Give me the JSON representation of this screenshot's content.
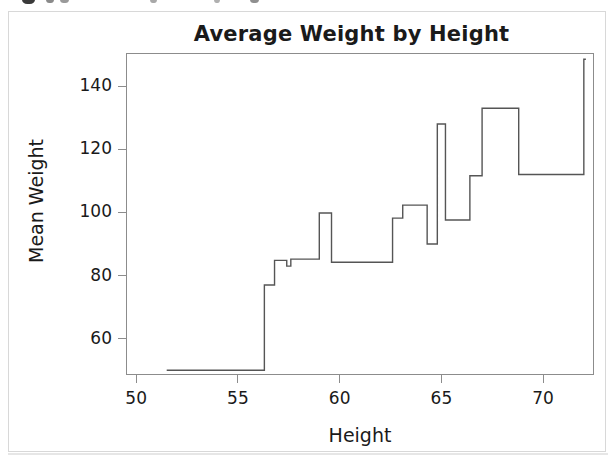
{
  "figure": {
    "background_color": "#ffffff",
    "frame_color": "#d8d8d8",
    "axis_color": "#8c8c8c",
    "line_color": "#555555",
    "text_color": "#1a1a1a"
  },
  "chart_data": {
    "type": "line",
    "subtype": "step",
    "title": "Average Weight by Height",
    "xlabel": "Height",
    "ylabel": "Mean Weight",
    "grid": false,
    "legend": null,
    "xlim": [
      49.5,
      72.5
    ],
    "ylim": [
      48.5,
      150.5
    ],
    "xticks": [
      50,
      55,
      60,
      65,
      70
    ],
    "yticks": [
      60,
      80,
      100,
      120,
      140
    ],
    "xtick_labels": [
      "50",
      "55",
      "60",
      "65",
      "70"
    ],
    "ytick_labels": [
      "60",
      "80",
      "100",
      "120",
      "140"
    ],
    "series": [
      {
        "name": "Mean Weight",
        "x": [
          51.5,
          56.3,
          56.3,
          56.8,
          56.8,
          57.4,
          57.4,
          57.6,
          57.6,
          59.0,
          59.0,
          59.6,
          59.6,
          62.6,
          62.6,
          63.1,
          63.1,
          64.3,
          64.3,
          64.8,
          64.8,
          65.2,
          65.2,
          66.4,
          66.4,
          67.0,
          67.0,
          68.8,
          68.8,
          72.0,
          72.0,
          72.1
        ],
        "y": [
          50.0,
          50.0,
          77.0,
          77.0,
          84.8,
          84.8,
          83.0,
          83.0,
          85.2,
          85.2,
          99.8,
          99.8,
          84.2,
          84.2,
          98.2,
          98.2,
          102.3,
          102.3,
          90.0,
          90.0,
          128.0,
          128.0,
          97.6,
          97.6,
          111.6,
          111.6,
          133.0,
          133.0,
          112.0,
          112.0,
          148.5,
          148.5
        ],
        "steps": [
          {
            "x_start": 51.5,
            "x_end": 56.3,
            "y": 50.0
          },
          {
            "x_start": 56.3,
            "x_end": 56.8,
            "y": 77.0
          },
          {
            "x_start": 56.8,
            "x_end": 57.4,
            "y": 84.8
          },
          {
            "x_start": 57.4,
            "x_end": 57.6,
            "y": 83.0
          },
          {
            "x_start": 57.6,
            "x_end": 59.0,
            "y": 85.2
          },
          {
            "x_start": 59.0,
            "x_end": 59.6,
            "y": 99.8
          },
          {
            "x_start": 59.6,
            "x_end": 62.6,
            "y": 84.2
          },
          {
            "x_start": 62.6,
            "x_end": 63.1,
            "y": 98.2
          },
          {
            "x_start": 63.1,
            "x_end": 64.3,
            "y": 102.3
          },
          {
            "x_start": 64.3,
            "x_end": 64.8,
            "y": 90.0
          },
          {
            "x_start": 64.8,
            "x_end": 65.2,
            "y": 128.0
          },
          {
            "x_start": 65.2,
            "x_end": 66.4,
            "y": 97.6
          },
          {
            "x_start": 66.4,
            "x_end": 67.0,
            "y": 111.6
          },
          {
            "x_start": 67.0,
            "x_end": 68.8,
            "y": 133.0
          },
          {
            "x_start": 68.8,
            "x_end": 72.0,
            "y": 112.0
          },
          {
            "x_start": 72.0,
            "x_end": 72.1,
            "y": 148.5
          }
        ]
      }
    ]
  }
}
